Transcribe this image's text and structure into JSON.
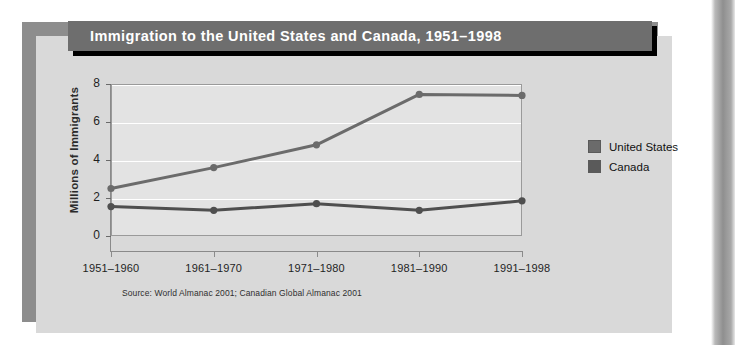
{
  "title": "Immigration to the United States and Canada, 1951–1998",
  "source_note": "Source: World Almanac 2001; Canadian Global Almanac 2001",
  "legend": {
    "items": [
      {
        "label": "United States",
        "color": "#6b6b6b"
      },
      {
        "label": "Canada",
        "color": "#5a5a5a"
      }
    ]
  },
  "colors": {
    "page_background": "#ffffff",
    "card_background": "#d9d9d9",
    "shadow_panel": "#8d8d8d",
    "title_bar": "#6e6e6e",
    "title_text": "#ffffff",
    "plot_background": "#e3e3e3",
    "gridline": "#ffffff",
    "axis": "#8a8a8a",
    "series_united_states": "#6b6b6b",
    "series_canada": "#4f4f4f"
  },
  "chart_data": {
    "type": "line",
    "title": "Immigration to the United States and Canada, 1951–1998",
    "xlabel": "",
    "ylabel": "Millions of Immigrants",
    "categories": [
      "1951–1960",
      "1961–1970",
      "1971–1980",
      "1981–1990",
      "1991–1998"
    ],
    "yticks": [
      0,
      2,
      4,
      6,
      8
    ],
    "ylim": [
      0,
      8
    ],
    "grid": true,
    "legend_position": "right",
    "series": [
      {
        "name": "United States",
        "values": [
          2.5,
          3.6,
          4.8,
          7.45,
          7.4
        ]
      },
      {
        "name": "Canada",
        "values": [
          1.55,
          1.35,
          1.7,
          1.35,
          1.85
        ]
      }
    ]
  }
}
